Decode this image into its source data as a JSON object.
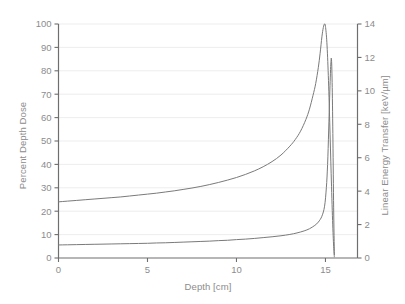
{
  "chart_data": {
    "type": "line",
    "title": "",
    "xlabel": "Depth [cm]",
    "ylabel": "Percent Depth Dose",
    "y2label": "Linear Energy Transfer [keV/µm]",
    "xlim": [
      0,
      16.8
    ],
    "ylim": [
      0,
      100
    ],
    "y2lim": [
      0,
      14
    ],
    "xticks": [
      0,
      5,
      10,
      15
    ],
    "xticklabels": [
      "0",
      "5",
      "10",
      "15"
    ],
    "yticks": [
      0,
      10,
      20,
      30,
      40,
      50,
      60,
      70,
      80,
      90,
      100
    ],
    "yticklabels": [
      "0",
      "10",
      "20",
      "30",
      "40",
      "50",
      "60",
      "70",
      "80",
      "90",
      "100"
    ],
    "y2ticks": [
      0,
      2,
      4,
      6,
      8,
      10,
      12,
      14
    ],
    "y2ticklabels": [
      "0",
      "2",
      "4",
      "6",
      "8",
      "10",
      "12",
      "14"
    ],
    "grid": "horizontal",
    "legend": "none",
    "series": [
      {
        "name": "Percent Depth Dose",
        "axis": "left",
        "color": "#7a7a7a",
        "x": [
          0.0,
          0.5,
          1.0,
          1.5,
          2.0,
          2.5,
          3.0,
          3.5,
          4.0,
          4.5,
          5.0,
          5.5,
          6.0,
          6.5,
          7.0,
          7.5,
          8.0,
          8.5,
          9.0,
          9.5,
          10.0,
          10.5,
          11.0,
          11.5,
          12.0,
          12.5,
          13.0,
          13.3,
          13.6,
          13.9,
          14.1,
          14.3,
          14.45,
          14.6,
          14.7,
          14.8,
          14.88,
          14.95,
          15.0,
          15.08,
          15.16,
          15.24,
          15.32,
          15.4,
          15.46,
          15.5
        ],
        "values": [
          24.0,
          24.3,
          24.6,
          24.9,
          25.2,
          25.5,
          25.8,
          26.1,
          26.5,
          26.9,
          27.3,
          27.7,
          28.2,
          28.7,
          29.3,
          29.9,
          30.6,
          31.4,
          32.3,
          33.3,
          34.4,
          35.7,
          37.2,
          39.0,
          41.2,
          44.0,
          47.8,
          50.6,
          54.2,
          59.2,
          63.6,
          69.5,
          74.5,
          81.5,
          87.5,
          94.5,
          98.5,
          100.0,
          99.0,
          92.0,
          78.0,
          58.0,
          36.0,
          16.0,
          5.0,
          0.5
        ]
      },
      {
        "name": "Linear Energy Transfer",
        "axis": "right",
        "color": "#7a7a7a",
        "x": [
          0.0,
          0.5,
          1.0,
          1.5,
          2.0,
          2.5,
          3.0,
          3.5,
          4.0,
          4.5,
          5.0,
          5.5,
          6.0,
          6.5,
          7.0,
          7.5,
          8.0,
          8.5,
          9.0,
          9.5,
          10.0,
          10.5,
          11.0,
          11.5,
          12.0,
          12.5,
          13.0,
          13.4,
          13.8,
          14.1,
          14.4,
          14.6,
          14.8,
          14.95,
          15.05,
          15.12,
          15.18,
          15.24,
          15.3,
          15.34,
          15.38,
          15.42,
          15.46,
          15.5
        ],
        "values": [
          0.78,
          0.79,
          0.8,
          0.81,
          0.82,
          0.83,
          0.84,
          0.85,
          0.86,
          0.87,
          0.88,
          0.9,
          0.91,
          0.93,
          0.95,
          0.97,
          0.99,
          1.01,
          1.04,
          1.06,
          1.1,
          1.13,
          1.17,
          1.22,
          1.27,
          1.33,
          1.41,
          1.5,
          1.62,
          1.75,
          1.95,
          2.15,
          2.5,
          3.1,
          4.2,
          5.6,
          7.6,
          9.8,
          11.6,
          11.85,
          10.2,
          7.0,
          3.0,
          0.2
        ]
      }
    ]
  },
  "axes": {
    "x_title": "Depth [cm]",
    "y_left_title": "Percent Depth Dose",
    "y_right_title": "Linear Energy Transfer [keV/µm]"
  },
  "colors": {
    "background": "#ffffff",
    "axis": "#6e6e6e",
    "grid": "#ebebeb",
    "tick_label": "#8c8c8c",
    "curve": "#7a7a7a"
  }
}
